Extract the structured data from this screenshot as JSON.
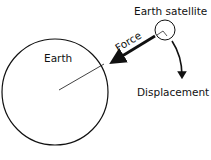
{
  "diagram": {
    "labels": {
      "earth": "Earth",
      "satellite": "Earth satellite",
      "force": "Force",
      "displacement": "Displacement"
    },
    "colors": {
      "ink": "#111111",
      "background": "#ffffff"
    },
    "elements": [
      {
        "name": "earth",
        "shape": "circle",
        "label": "Earth"
      },
      {
        "name": "earth-satellite",
        "shape": "circle",
        "label": "Earth satellite"
      },
      {
        "name": "force-arrow",
        "shape": "arrow",
        "label": "Force",
        "direction": "toward Earth center"
      },
      {
        "name": "displacement-arrow",
        "shape": "curved-arrow",
        "label": "Displacement",
        "direction": "tangential, downward"
      },
      {
        "name": "radius-line",
        "shape": "line"
      },
      {
        "name": "right-angle-mark",
        "shape": "angle-mark"
      }
    ]
  }
}
